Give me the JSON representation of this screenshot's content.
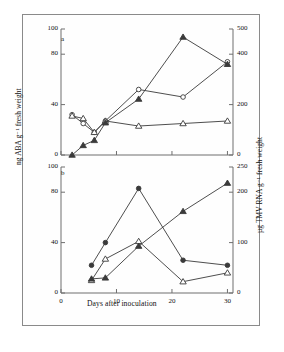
{
  "figure": {
    "xlabel": "Days after inoculation",
    "ylabel_left": "ng ABA g⁻¹ fresh weight",
    "ylabel_right": "µg TMV RNA g⁻¹ fresh weight",
    "panel_a_letter": "a",
    "panel_b_letter": "b"
  },
  "ticks": {
    "x": [
      "0",
      "10",
      "20",
      "30"
    ],
    "panel_a_left": [
      "0",
      "40",
      "80",
      "100"
    ],
    "panel_a_right": [
      "0",
      "200",
      "400",
      "500"
    ],
    "panel_b_left": [
      "0",
      "40",
      "80",
      "100"
    ],
    "panel_b_right": [
      "0",
      "100",
      "200",
      "250"
    ]
  },
  "chart_data": [
    {
      "type": "line",
      "panel": "a",
      "title": "",
      "xlabel": "Days after inoculation",
      "ylabel": "ng ABA g⁻¹ fresh weight",
      "ylabel_right": "µg TMV RNA g⁻¹ fresh weight",
      "xlim": [
        0,
        31
      ],
      "ylim": [
        0,
        100
      ],
      "ylim_right": [
        0,
        500
      ],
      "xticks": [
        0,
        10,
        20,
        30
      ],
      "yticks": [
        0,
        40,
        80,
        100
      ],
      "yticks_right": [
        0,
        200,
        400,
        500
      ],
      "grid": false,
      "legend": "none",
      "series": [
        {
          "name": "open-circle-series",
          "marker": "open-circle",
          "axis": "left",
          "x": [
            2.0,
            4.0,
            6.0,
            8.0,
            14.0,
            22.0,
            30.0
          ],
          "values": [
            32,
            25,
            18,
            27,
            52,
            46,
            74
          ]
        },
        {
          "name": "open-triangle-series",
          "marker": "open-triangle",
          "axis": "left",
          "x": [
            2.0,
            4.0,
            6.0,
            8.0,
            14.0,
            22.0,
            30.0
          ],
          "values": [
            31,
            29,
            18,
            27,
            23,
            25,
            27
          ]
        },
        {
          "name": "filled-triangle-series",
          "marker": "filled-triangle",
          "axis": "right",
          "x": [
            2.0,
            4.0,
            6.0,
            8.0,
            14.0,
            22.0,
            30.0
          ],
          "values": [
            0,
            38,
            58,
            128,
            222,
            468,
            360
          ]
        }
      ]
    },
    {
      "type": "line",
      "panel": "b",
      "title": "",
      "xlabel": "Days after inoculation",
      "ylabel": "ng ABA g⁻¹ fresh weight",
      "ylabel_right": "µg TMV RNA g⁻¹ fresh weight",
      "xlim": [
        0,
        31
      ],
      "ylim": [
        0,
        100
      ],
      "ylim_right": [
        0,
        250
      ],
      "xticks": [
        0,
        10,
        20,
        30
      ],
      "yticks": [
        0,
        40,
        80,
        100
      ],
      "yticks_right": [
        0,
        100,
        200,
        250
      ],
      "grid": false,
      "legend": "none",
      "series": [
        {
          "name": "filled-circle-series",
          "marker": "filled-circle",
          "axis": "left",
          "x": [
            5.5,
            8.0,
            14.0,
            22.0,
            30.0
          ],
          "values": [
            22,
            40,
            83,
            26,
            22
          ]
        },
        {
          "name": "open-triangle-series",
          "marker": "open-triangle",
          "axis": "left",
          "x": [
            5.5,
            8.0,
            14.0,
            22.0,
            30.0
          ],
          "values": [
            10,
            27,
            41,
            9,
            16
          ]
        },
        {
          "name": "filled-triangle-series",
          "marker": "filled-triangle",
          "axis": "right",
          "x": [
            5.5,
            8.0,
            14.0,
            22.0,
            30.0
          ],
          "values": [
            28,
            30,
            93,
            162,
            218
          ]
        }
      ]
    }
  ]
}
